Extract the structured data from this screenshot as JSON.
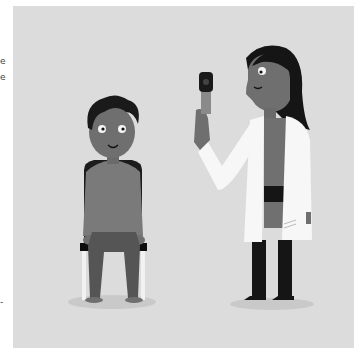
{
  "edge_fragments": [
    "e",
    "e",
    "-"
  ],
  "illustration": {
    "description": "Grayscale illustration of a doctor in a white coat holding an otoscope/ophthalmoscope, and a boy sitting on a chair",
    "colors": {
      "background_panel": "#dcdcdc",
      "skin": "#6f6f6f",
      "hair": "#1a1a1a",
      "coat": "#f7f7f7",
      "shirt_boy": "#7a7a7a",
      "pants_boy": "#555555",
      "chair": "#111111",
      "legs_doctor": "#151515",
      "shadow": "#c8c8c8"
    }
  }
}
